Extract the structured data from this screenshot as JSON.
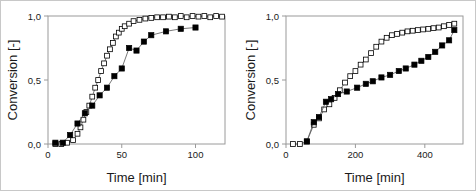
{
  "figure": {
    "background": "#ffffff",
    "border_color": "#c8c8c8",
    "frame_color": "#9a9a9a",
    "line_color": "#555555",
    "marker_open_fill": "#ffffff",
    "marker_filled_fill": "#000000",
    "marker_stroke": "#000000"
  },
  "chart_data": [
    {
      "id": "left",
      "type": "line",
      "title": "",
      "xlabel": "Time [min]",
      "ylabel": "Conversion [-]",
      "xlim": [
        0,
        120
      ],
      "ylim": [
        0,
        1.0
      ],
      "xticks": [
        0,
        50,
        100
      ],
      "xticklabels": [
        "0",
        "50",
        "100"
      ],
      "yticks": [
        0,
        0.5,
        1.0
      ],
      "yticklabels": [
        "0,0",
        "0,5",
        "1,0"
      ],
      "grid": false,
      "legend": "none",
      "series": [
        {
          "name": "open-squares",
          "marker": "open-square",
          "x": [
            5,
            9,
            13,
            17,
            20,
            22,
            24,
            26,
            28,
            30,
            32,
            34,
            36,
            38,
            40,
            42,
            44,
            46,
            48,
            50,
            52,
            55,
            58,
            62,
            66,
            70,
            74,
            78,
            82,
            86,
            90,
            94,
            98,
            102,
            106,
            110,
            114,
            118
          ],
          "y": [
            0.0,
            0.0,
            0.01,
            0.03,
            0.08,
            0.13,
            0.19,
            0.25,
            0.3,
            0.37,
            0.44,
            0.5,
            0.57,
            0.63,
            0.69,
            0.74,
            0.79,
            0.84,
            0.87,
            0.9,
            0.92,
            0.94,
            0.96,
            0.97,
            0.98,
            0.985,
            0.99,
            0.99,
            0.995,
            0.99,
            1.0,
            0.99,
            1.0,
            0.995,
            1.0,
            0.99,
            1.0,
            0.995
          ]
        },
        {
          "name": "filled-squares",
          "marker": "filled-square",
          "x": [
            5,
            10,
            15,
            20,
            25,
            30,
            35,
            40,
            45,
            50,
            55,
            60,
            65,
            70,
            80,
            90,
            100
          ],
          "y": [
            0.01,
            0.01,
            0.07,
            0.16,
            0.24,
            0.3,
            0.38,
            0.44,
            0.53,
            0.59,
            0.75,
            0.73,
            0.8,
            0.85,
            0.88,
            0.9,
            0.91
          ]
        }
      ]
    },
    {
      "id": "right",
      "type": "line",
      "title": "",
      "xlabel": "Time [min]",
      "ylabel": "Conversion [-]",
      "xlim": [
        0,
        510
      ],
      "ylim": [
        0,
        1.0
      ],
      "xticks": [
        0,
        200,
        400
      ],
      "xticklabels": [
        "0",
        "200",
        "400"
      ],
      "yticks": [
        0,
        0.5,
        1.0
      ],
      "yticklabels": [
        "0,0",
        "0,5",
        "1,0"
      ],
      "grid": false,
      "legend": "none",
      "series": [
        {
          "name": "open-squares",
          "marker": "open-square",
          "x": [
            20,
            40,
            60,
            80,
            95,
            110,
            125,
            140,
            155,
            170,
            185,
            200,
            215,
            230,
            245,
            260,
            275,
            290,
            305,
            320,
            335,
            350,
            365,
            380,
            395,
            410,
            425,
            440,
            455,
            470,
            485
          ],
          "y": [
            0.0,
            0.0,
            0.02,
            0.15,
            0.2,
            0.27,
            0.31,
            0.36,
            0.42,
            0.48,
            0.53,
            0.57,
            0.62,
            0.66,
            0.71,
            0.76,
            0.8,
            0.83,
            0.85,
            0.86,
            0.87,
            0.88,
            0.885,
            0.89,
            0.895,
            0.9,
            0.905,
            0.91,
            0.92,
            0.93,
            0.94
          ]
        },
        {
          "name": "filled-squares",
          "marker": "filled-square",
          "x": [
            60,
            80,
            95,
            115,
            130,
            150,
            175,
            205,
            230,
            250,
            275,
            300,
            325,
            345,
            370,
            390,
            410,
            430,
            450,
            470,
            485
          ],
          "y": [
            0.02,
            0.17,
            0.21,
            0.33,
            0.35,
            0.39,
            0.41,
            0.44,
            0.47,
            0.49,
            0.52,
            0.54,
            0.57,
            0.59,
            0.62,
            0.65,
            0.68,
            0.72,
            0.77,
            0.81,
            0.89
          ]
        }
      ]
    }
  ]
}
